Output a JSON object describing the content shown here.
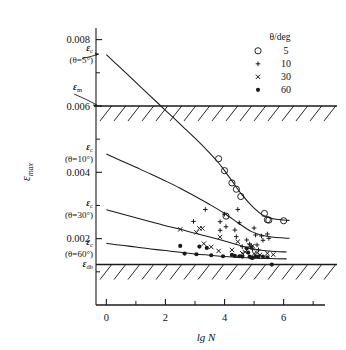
{
  "chart_data": {
    "type": "scatter",
    "title": "",
    "xlabel": "lg N",
    "ylabel": "εmax",
    "xlim": [
      -0.35,
      7.4
    ],
    "ylim": [
      0.0,
      0.00835
    ],
    "grid": false,
    "x_ticks_major": [
      0,
      2,
      4,
      6
    ],
    "x_tick_labels": [
      "0",
      "2",
      "4",
      "6"
    ],
    "x_ticks_minor": [
      1,
      3,
      5,
      7
    ],
    "y_ticks_major": [
      0.002,
      0.004,
      0.006,
      0.008
    ],
    "y_tick_labels": [
      "0.002",
      "0.004",
      "0.006",
      "0.008"
    ],
    "y_ticks_minor": [
      0.001,
      0.003,
      0.005,
      0.007
    ],
    "legend_position": "top-right",
    "legend_title": "θ/deg",
    "bands": [
      {
        "name": "epsilon-m-band",
        "label": "εm",
        "value": 0.006,
        "hatch_side": "below"
      },
      {
        "name": "epsilon-db-band",
        "label": "εdb",
        "value": 0.00122,
        "hatch_side": "below"
      }
    ],
    "annotations": [
      {
        "name": "eps-c-5",
        "label": "εc",
        "sub": "(θ=5°)",
        "value": 0.00755
      },
      {
        "name": "eps-m",
        "label": "εm",
        "value": 0.006
      },
      {
        "name": "eps-c-10",
        "label": "εc",
        "sub": "(θ=10°)",
        "value": 0.00455
      },
      {
        "name": "eps-c-30",
        "label": "εc",
        "sub": "(θ=30°)",
        "value": 0.00287
      },
      {
        "name": "eps-c-60",
        "label": "εc",
        "sub": "(θ=60°)",
        "value": 0.00186
      },
      {
        "name": "eps-db",
        "label": "εdb",
        "value": 0.00122
      }
    ],
    "series": [
      {
        "name": "theta-5",
        "label": "5",
        "marker": "open-circle",
        "curve": [
          [
            0.0,
            0.00755
          ],
          [
            0.5,
            0.00713
          ],
          [
            1.0,
            0.00671
          ],
          [
            1.5,
            0.00629
          ],
          [
            2.0,
            0.00587
          ],
          [
            2.5,
            0.00545
          ],
          [
            3.0,
            0.00503
          ],
          [
            3.5,
            0.00458
          ],
          [
            3.8,
            0.00428
          ],
          [
            4.0,
            0.00405
          ],
          [
            4.3,
            0.00368
          ],
          [
            4.6,
            0.00331
          ],
          [
            5.0,
            0.00292
          ],
          [
            5.3,
            0.00271
          ],
          [
            5.6,
            0.00261
          ],
          [
            6.0,
            0.00256
          ],
          [
            6.2,
            0.00255
          ]
        ],
        "points": [
          [
            3.8,
            0.00441
          ],
          [
            4.0,
            0.00405
          ],
          [
            4.05,
            0.00268
          ],
          [
            4.25,
            0.00368
          ],
          [
            4.4,
            0.00349
          ],
          [
            4.55,
            0.00327
          ],
          [
            5.35,
            0.00276
          ],
          [
            5.45,
            0.00257
          ],
          [
            5.5,
            0.00256
          ],
          [
            6.0,
            0.00254
          ]
        ]
      },
      {
        "name": "theta-10",
        "label": "10",
        "marker": "plus",
        "curve": [
          [
            0.0,
            0.00455
          ],
          [
            0.5,
            0.00435
          ],
          [
            1.0,
            0.00415
          ],
          [
            1.5,
            0.00395
          ],
          [
            2.0,
            0.00374
          ],
          [
            2.5,
            0.00352
          ],
          [
            3.0,
            0.00328
          ],
          [
            3.5,
            0.00303
          ],
          [
            4.0,
            0.00276
          ],
          [
            4.5,
            0.00245
          ],
          [
            4.9,
            0.00222
          ],
          [
            5.2,
            0.00212
          ],
          [
            5.6,
            0.00205
          ],
          [
            6.0,
            0.00202
          ],
          [
            6.2,
            0.00201
          ]
        ],
        "points": [
          [
            2.95,
            0.00252
          ],
          [
            3.35,
            0.00288
          ],
          [
            3.85,
            0.00251
          ],
          [
            3.85,
            0.00225
          ],
          [
            4.0,
            0.00274
          ],
          [
            4.05,
            0.00236
          ],
          [
            4.35,
            0.00226
          ],
          [
            4.4,
            0.00206
          ],
          [
            4.5,
            0.00248
          ],
          [
            4.6,
            0.00176
          ],
          [
            4.75,
            0.00196
          ],
          [
            4.85,
            0.00184
          ],
          [
            4.9,
            0.00176
          ],
          [
            4.95,
            0.00168
          ],
          [
            5.0,
            0.00232
          ],
          [
            5.1,
            0.00181
          ],
          [
            5.15,
            0.00166
          ],
          [
            5.25,
            0.00208
          ],
          [
            5.3,
            0.00195
          ],
          [
            5.45,
            0.00214
          ],
          [
            5.5,
            0.00201
          ],
          [
            4.45,
            0.00288
          ],
          [
            5.05,
            0.00211
          ]
        ]
      },
      {
        "name": "theta-30",
        "label": "30",
        "marker": "cross",
        "curve": [
          [
            0.0,
            0.00287
          ],
          [
            0.5,
            0.00275
          ],
          [
            1.0,
            0.00263
          ],
          [
            1.5,
            0.00251
          ],
          [
            2.0,
            0.00239
          ],
          [
            2.5,
            0.00228
          ],
          [
            3.0,
            0.00216
          ],
          [
            3.5,
            0.00205
          ],
          [
            4.0,
            0.00193
          ],
          [
            4.5,
            0.0018
          ],
          [
            4.9,
            0.0017
          ],
          [
            5.3,
            0.00164
          ],
          [
            5.7,
            0.00161
          ],
          [
            6.1,
            0.0016
          ]
        ],
        "points": [
          [
            2.5,
            0.00228
          ],
          [
            3.05,
            0.00219
          ],
          [
            3.15,
            0.00231
          ],
          [
            3.25,
            0.00231
          ],
          [
            3.3,
            0.00185
          ],
          [
            3.55,
            0.00175
          ],
          [
            3.8,
            0.00163
          ],
          [
            3.85,
            0.00205
          ],
          [
            4.25,
            0.00166
          ],
          [
            4.45,
            0.00191
          ],
          [
            4.6,
            0.00156
          ],
          [
            4.7,
            0.0016
          ],
          [
            4.85,
            0.00178
          ],
          [
            4.9,
            0.00175
          ],
          [
            4.95,
            0.00178
          ],
          [
            5.0,
            0.00155
          ],
          [
            5.1,
            0.00158
          ],
          [
            5.2,
            0.00151
          ],
          [
            5.45,
            0.00156
          ],
          [
            5.65,
            0.00152
          ]
        ]
      },
      {
        "name": "theta-60",
        "label": "60",
        "marker": "filled-circle",
        "curve": [
          [
            0.0,
            0.00186
          ],
          [
            0.5,
            0.0018
          ],
          [
            1.0,
            0.00175
          ],
          [
            1.5,
            0.00169
          ],
          [
            2.0,
            0.00164
          ],
          [
            2.5,
            0.00159
          ],
          [
            3.0,
            0.00154
          ],
          [
            3.5,
            0.0015
          ],
          [
            4.0,
            0.00146
          ],
          [
            4.5,
            0.00143
          ],
          [
            5.0,
            0.00141
          ],
          [
            5.5,
            0.0014
          ],
          [
            6.1,
            0.00139
          ]
        ],
        "points": [
          [
            2.5,
            0.00178
          ],
          [
            2.65,
            0.00155
          ],
          [
            3.05,
            0.00153
          ],
          [
            3.15,
            0.00176
          ],
          [
            3.4,
            0.00172
          ],
          [
            3.55,
            0.0015
          ],
          [
            3.95,
            0.00147
          ],
          [
            4.25,
            0.00151
          ],
          [
            4.35,
            0.00148
          ],
          [
            4.5,
            0.00147
          ],
          [
            4.6,
            0.00146
          ],
          [
            4.75,
            0.00171
          ],
          [
            4.8,
            0.00158
          ],
          [
            4.85,
            0.00146
          ],
          [
            4.9,
            0.00143
          ],
          [
            4.95,
            0.00142
          ],
          [
            5.05,
            0.00147
          ],
          [
            5.15,
            0.00146
          ],
          [
            5.3,
            0.00146
          ],
          [
            5.45,
            0.00144
          ],
          [
            5.6,
            0.00122
          ]
        ]
      }
    ]
  },
  "legend": {
    "title": "θ/deg",
    "items": [
      {
        "marker": "open-circle",
        "label": "5"
      },
      {
        "marker": "plus",
        "label": "10"
      },
      {
        "marker": "cross",
        "label": "30"
      },
      {
        "marker": "filled-circle",
        "label": "60"
      }
    ]
  },
  "axes": {
    "x_title": "lg N",
    "y_title": "εmax",
    "x_tick_labels": [
      "0",
      "2",
      "4",
      "6"
    ],
    "y_tick_labels": [
      "0.002",
      "0.004",
      "0.006",
      "0.008"
    ]
  },
  "colors": {
    "ink": "#1a1a1a",
    "background": "#ffffff"
  }
}
